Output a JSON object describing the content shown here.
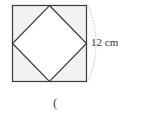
{
  "diagram": {
    "shape": "square with inscribed rotated square (midpoints connected)",
    "side_label": "12 cm",
    "answer_paren": "(",
    "colors": {
      "outline": "#3a3a3a",
      "corner_fill": "#f2f2f2",
      "inner_fill": "#ffffff",
      "brace": "#b0b0b0"
    }
  }
}
